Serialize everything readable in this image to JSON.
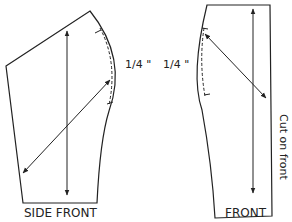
{
  "pieces": [
    {
      "id": "side-front",
      "label": "SIDE FRONT",
      "measurement": "1/4 \""
    },
    {
      "id": "front",
      "label": "FRONT",
      "measurement": "1/4 \"",
      "edge_note": "Cut on front"
    }
  ],
  "colors": {
    "line": "#222222",
    "background": "#ffffff"
  }
}
